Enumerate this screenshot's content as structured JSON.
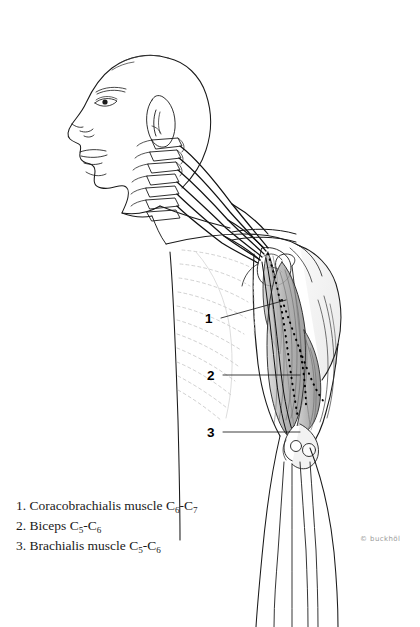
{
  "figure": {
    "background_color": "#ffffff",
    "ink_color": "#1a1a1a",
    "faint_color": "#b9b9b9"
  },
  "callouts": [
    {
      "id": "1",
      "label": "1",
      "x": 207,
      "y": 312,
      "line_x1": 221,
      "line_y1": 318,
      "line_x2": 286,
      "line_y2": 300
    },
    {
      "id": "2",
      "label": "2",
      "x": 209,
      "y": 369,
      "line_x1": 223,
      "line_y1": 375,
      "line_x2": 300,
      "line_y2": 375
    },
    {
      "id": "3",
      "label": "3",
      "x": 209,
      "y": 426,
      "line_x1": 223,
      "line_y1": 432,
      "line_x2": 300,
      "line_y2": 432
    }
  ],
  "legend": {
    "items": [
      {
        "number": "1.",
        "name": "Coracobrachialis muscle",
        "root_from": "C",
        "root_from_sub": "6",
        "root_to": "C",
        "root_to_sub": "7"
      },
      {
        "number": "2.",
        "name": "Biceps",
        "root_from": "C",
        "root_from_sub": "5",
        "root_to": "C",
        "root_to_sub": "6"
      },
      {
        "number": "3.",
        "name": "Brachialis muscle",
        "root_from": "C",
        "root_from_sub": "5",
        "root_to": "C",
        "root_to_sub": "6"
      }
    ]
  },
  "credit": {
    "symbol": "©",
    "text": "buckhöl"
  },
  "anatomy": {
    "regions": [
      "head-profile",
      "ear",
      "cervical-vertebrae",
      "brachial-plexus",
      "clavicle",
      "scapula",
      "ribcage",
      "deltoid",
      "biceps-brachii",
      "coracobrachialis",
      "brachialis",
      "humerus",
      "elbow-joint",
      "radius",
      "ulna"
    ]
  }
}
